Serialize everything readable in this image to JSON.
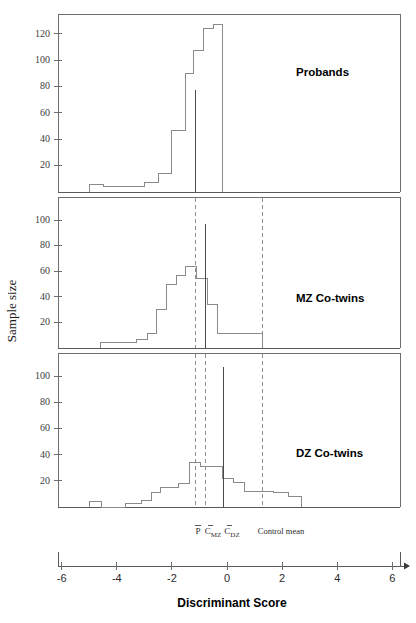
{
  "figure": {
    "xlabel": "Discriminant Score",
    "ylabel": "Sample size",
    "x_ticks": [
      -6,
      -4,
      -2,
      0,
      2,
      4,
      6
    ],
    "x_tick_labels": [
      "-6",
      "-4",
      "-2",
      "0",
      "2",
      "4",
      "6"
    ],
    "xlim": [
      -6.6,
      6.4
    ],
    "background_color": "#ffffff",
    "line_color": "#8a8a8a",
    "frame_color": "#6e6e6e"
  },
  "markers": {
    "proband_mean": {
      "label_main": "P",
      "label_sub": "",
      "value": -1.15
    },
    "mz_mean": {
      "label_main": "C",
      "label_sub": "MZ",
      "value": -0.78
    },
    "dz_mean": {
      "label_main": "C",
      "label_sub": "DZ",
      "value": -0.13
    },
    "control_mean": {
      "label_main": "Control mean",
      "label_sub": "",
      "value": 1.3
    }
  },
  "chart_data": [
    {
      "type": "bar",
      "title": "Probands",
      "xlabel": "Discriminant Score",
      "ylabel": "Sample size",
      "ylim": [
        0,
        135
      ],
      "y_ticks": [
        20,
        40,
        60,
        80,
        100,
        120
      ],
      "y_tick_labels": [
        "20",
        "40",
        "60",
        "80",
        "100",
        "120"
      ],
      "bin_width": 0.5,
      "bin_starts": [
        -5.0,
        -4.5,
        -4.0,
        -3.5,
        -3.0,
        -2.5,
        -2.0,
        -1.5,
        -1.0,
        -0.5
      ],
      "values": [
        6,
        4,
        4,
        4,
        7,
        14,
        47,
        90,
        107,
        124,
        127
      ],
      "bins": [
        {
          "x0": -5.0,
          "x1": -4.5,
          "count": 6
        },
        {
          "x0": -4.5,
          "x1": -4.0,
          "count": 4
        },
        {
          "x0": -4.0,
          "x1": -3.5,
          "count": 4
        },
        {
          "x0": -3.5,
          "x1": -3.0,
          "count": 4
        },
        {
          "x0": -3.0,
          "x1": -2.5,
          "count": 7
        },
        {
          "x0": -2.5,
          "x1": -2.0,
          "count": 14
        },
        {
          "x0": -2.0,
          "x1": -1.5,
          "count": 47
        },
        {
          "x0": -1.5,
          "x1": -1.2,
          "count": 90
        },
        {
          "x0": -1.2,
          "x1": -0.85,
          "count": 107
        },
        {
          "x0": -0.85,
          "x1": -0.5,
          "count": 124
        },
        {
          "x0": -0.5,
          "x1": -0.15,
          "count": 127
        }
      ],
      "mean_lines": [
        {
          "name": "proband_mean",
          "value": -1.15,
          "style": "solid"
        }
      ],
      "dashed_refs": []
    },
    {
      "type": "bar",
      "title": "MZ Co-twins",
      "xlabel": "Discriminant Score",
      "ylabel": "Sample size",
      "ylim": [
        0,
        118
      ],
      "y_ticks": [
        20,
        40,
        60,
        80,
        100
      ],
      "y_tick_labels": [
        "20",
        "40",
        "60",
        "80",
        "100"
      ],
      "bin_width": 0.5,
      "bins": [
        {
          "x0": -4.6,
          "x1": -3.3,
          "count": 4
        },
        {
          "x0": -3.3,
          "x1": -2.9,
          "count": 7
        },
        {
          "x0": -2.9,
          "x1": -2.55,
          "count": 11
        },
        {
          "x0": -2.55,
          "x1": -2.2,
          "count": 30
        },
        {
          "x0": -2.2,
          "x1": -1.85,
          "count": 50
        },
        {
          "x0": -1.85,
          "x1": -1.5,
          "count": 57
        },
        {
          "x0": -1.5,
          "x1": -1.1,
          "count": 64
        },
        {
          "x0": -1.1,
          "x1": -0.72,
          "count": 54
        },
        {
          "x0": -0.72,
          "x1": -0.35,
          "count": 34
        },
        {
          "x0": -0.35,
          "x1": 1.3,
          "count": 11
        }
      ],
      "mean_lines": [
        {
          "name": "mz_mean",
          "value": -0.78,
          "style": "solid"
        }
      ],
      "dashed_refs": [
        {
          "name": "proband_mean",
          "value": -1.15
        },
        {
          "name": "control_mean",
          "value": 1.3
        }
      ]
    },
    {
      "type": "bar",
      "title": "DZ Co-twins",
      "xlabel": "Discriminant Score",
      "ylabel": "Sample size",
      "ylim": [
        0,
        118
      ],
      "y_ticks": [
        20,
        40,
        60,
        80,
        100
      ],
      "y_tick_labels": [
        "20",
        "40",
        "60",
        "80",
        "100"
      ],
      "bin_width": 0.5,
      "bins": [
        {
          "x0": -5.0,
          "x1": -4.55,
          "count": 4
        },
        {
          "x0": -4.55,
          "x1": -3.7,
          "count": 0
        },
        {
          "x0": -3.7,
          "x1": -3.1,
          "count": 3
        },
        {
          "x0": -3.1,
          "x1": -2.75,
          "count": 5
        },
        {
          "x0": -2.75,
          "x1": -2.4,
          "count": 11
        },
        {
          "x0": -2.4,
          "x1": -1.75,
          "count": 15
        },
        {
          "x0": -1.75,
          "x1": -1.35,
          "count": 18
        },
        {
          "x0": -1.35,
          "x1": -0.95,
          "count": 34
        },
        {
          "x0": -0.95,
          "x1": -0.55,
          "count": 31
        },
        {
          "x0": -0.55,
          "x1": -0.15,
          "count": 31
        },
        {
          "x0": -0.15,
          "x1": 0.25,
          "count": 22
        },
        {
          "x0": 0.25,
          "x1": 0.65,
          "count": 19
        },
        {
          "x0": 0.65,
          "x1": 1.7,
          "count": 12
        },
        {
          "x0": 1.7,
          "x1": 2.25,
          "count": 11
        },
        {
          "x0": 2.25,
          "x1": 2.7,
          "count": 8
        }
      ],
      "mean_lines": [
        {
          "name": "dz_mean",
          "value": -0.13,
          "style": "solid"
        }
      ],
      "dashed_refs": [
        {
          "name": "proband_mean",
          "value": -1.15
        },
        {
          "name": "mz_mean",
          "value": -0.78
        },
        {
          "name": "control_mean",
          "value": 1.3
        }
      ]
    }
  ]
}
